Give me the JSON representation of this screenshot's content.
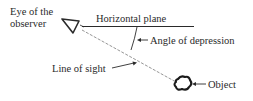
{
  "diagram": {
    "labels": {
      "eye_line1": "Eye of the",
      "eye_line2": "observer",
      "horizontal_plane": "Horizontal plane",
      "angle": "Angle of depression",
      "line_of_sight": "Line of sight",
      "object": "Object"
    },
    "icons": {
      "eye": "inverted-triangle-eye-icon",
      "object": "irregular-blob-object-icon"
    },
    "colors": {
      "ink": "#2a2a2a",
      "dashed_line": "#8a8a8a",
      "background": "#ffffff"
    }
  }
}
